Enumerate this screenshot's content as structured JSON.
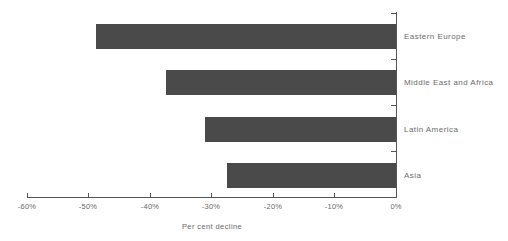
{
  "chart_data": {
    "type": "bar",
    "orientation": "horizontal",
    "title": "",
    "subtitle": "",
    "xlabel": "Per cent decline",
    "ylabel": "",
    "categories": [
      "Eastern Europe",
      "Middle East and Africa",
      "Latin America",
      "Asia"
    ],
    "values": [
      -48.7,
      -37.4,
      -31.1,
      -27.5
    ],
    "series": [
      {
        "name": "Per cent decline",
        "values": [
          -48.7,
          -37.4,
          -31.1,
          -27.5
        ]
      }
    ],
    "xlim": [
      -60,
      0
    ],
    "ylim": null,
    "xticks": [
      -60,
      -50,
      -40,
      -30,
      -20,
      -10,
      0
    ],
    "xtick_labels": [
      "-60%",
      "-50%",
      "-40%",
      "-30%",
      "-20%",
      "-10%",
      "0%"
    ],
    "grid": false,
    "legend": null,
    "legend_position": "none",
    "annotations": [],
    "colors": {
      "bar": "#4a4a4a",
      "axis": "#555555",
      "text": "#6a6a6a",
      "background": "#ffffff"
    }
  },
  "axis": {
    "x_title": "Per cent decline",
    "tick_labels": [
      "-60%",
      "-50%",
      "-40%",
      "-30%",
      "-20%",
      "-10%",
      "0%"
    ]
  },
  "bars": [
    {
      "label": "Eastern Europe",
      "value": -48.7
    },
    {
      "label": "Middle East and Africa",
      "value": -37.4
    },
    {
      "label": "Latin America",
      "value": -31.1
    },
    {
      "label": "Asia",
      "value": -27.5
    }
  ]
}
